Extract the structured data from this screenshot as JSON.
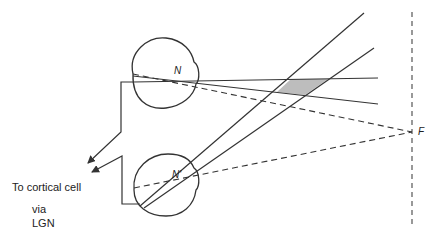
{
  "diagram": {
    "type": "binocular-disparity-geometry",
    "labels": {
      "nodal_point_upper": "N",
      "nodal_point_lower": "N'",
      "fixation_point": "F",
      "output_line1": "To cortical cell",
      "output_line2": "via",
      "output_line3": "LGN"
    },
    "elements": {
      "upper_eye": "Eye with nodal point N",
      "lower_eye": "Eye with nodal point N'",
      "fixation_plane": "Dashed vertical line through F",
      "shaded_region": "Region of overlapping receptive fields (binocular disparity zone)",
      "arrows": "Two arrows converging toward cortical cell"
    },
    "colors": {
      "line": "#333333",
      "shade": "#bdbdbd",
      "background": "#ffffff"
    }
  }
}
